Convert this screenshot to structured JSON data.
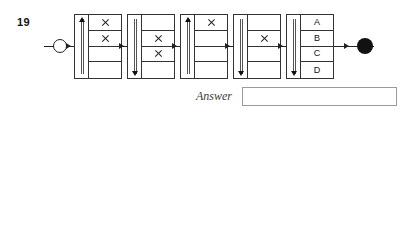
{
  "page": {
    "background": "#ffffff",
    "ink": "#222222",
    "answer_label": "Answer",
    "answer_placeholder": ""
  },
  "questions": [
    {
      "number": "19",
      "start_marker": "hollow-circle",
      "end_marker": "filled-circle",
      "answer_label": "Answer",
      "answer_value": "",
      "boxes": [
        {
          "index": 1,
          "arrow": "up",
          "cells": [
            {
              "mark": "cross",
              "label": ""
            },
            {
              "mark": "cross",
              "label": ""
            },
            {
              "mark": "",
              "label": ""
            },
            {
              "mark": "",
              "label": ""
            }
          ]
        },
        {
          "index": 2,
          "arrow": "down",
          "cells": [
            {
              "mark": "",
              "label": ""
            },
            {
              "mark": "cross",
              "label": ""
            },
            {
              "mark": "cross",
              "label": ""
            },
            {
              "mark": "",
              "label": ""
            }
          ]
        },
        {
          "index": 3,
          "arrow": "up",
          "cells": [
            {
              "mark": "cross",
              "label": ""
            },
            {
              "mark": "",
              "label": ""
            },
            {
              "mark": "",
              "label": ""
            },
            {
              "mark": "",
              "label": ""
            }
          ]
        },
        {
          "index": 4,
          "arrow": "down",
          "cells": [
            {
              "mark": "",
              "label": ""
            },
            {
              "mark": "cross",
              "label": ""
            },
            {
              "mark": "",
              "label": ""
            },
            {
              "mark": "",
              "label": ""
            }
          ]
        },
        {
          "index": 5,
          "arrow": "down",
          "options": true,
          "cells": [
            {
              "mark": "",
              "label": "A"
            },
            {
              "mark": "",
              "label": "B"
            },
            {
              "mark": "",
              "label": "C"
            },
            {
              "mark": "",
              "label": "D"
            }
          ]
        }
      ]
    },
    {
      "number": "20",
      "start_marker": "filled-dot",
      "end_marker": "filled-circle",
      "answer_label": "Answer",
      "answer_value": "",
      "boxes": [
        {
          "index": 1,
          "arrow": "down",
          "cells": [
            {
              "mark": "",
              "label": ""
            },
            {
              "mark": "cross",
              "label": ""
            },
            {
              "mark": "cross",
              "label": ""
            },
            {
              "mark": "",
              "label": ""
            }
          ]
        },
        {
          "index": 2,
          "arrow": "down",
          "cells": [
            {
              "mark": "cross",
              "label": ""
            },
            {
              "mark": "cross",
              "label": ""
            },
            {
              "mark": "cross",
              "label": ""
            },
            {
              "mark": "cross",
              "label": ""
            }
          ]
        },
        {
          "index": 3,
          "arrow": "up",
          "cells": [
            {
              "mark": "cross",
              "label": ""
            },
            {
              "mark": "",
              "label": ""
            },
            {
              "mark": "",
              "label": ""
            },
            {
              "mark": "",
              "label": ""
            }
          ]
        },
        {
          "index": 4,
          "arrow": "down",
          "cells": [
            {
              "mark": "",
              "label": ""
            },
            {
              "mark": "cross",
              "label": ""
            },
            {
              "mark": "",
              "label": ""
            },
            {
              "mark": "",
              "label": ""
            }
          ]
        },
        {
          "index": 5,
          "arrow": "up",
          "options": true,
          "cells": [
            {
              "mark": "",
              "label": "A"
            },
            {
              "mark": "",
              "label": "B"
            },
            {
              "mark": "",
              "label": "C"
            },
            {
              "mark": "",
              "label": "D"
            }
          ]
        }
      ]
    }
  ]
}
